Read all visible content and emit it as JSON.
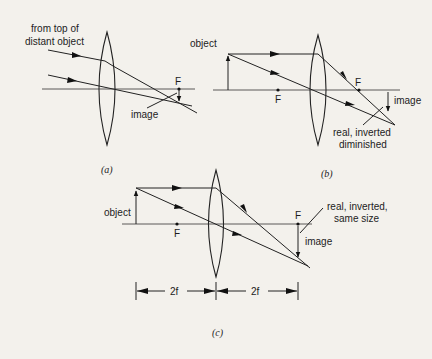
{
  "figure": {
    "panels": [
      {
        "id": "a",
        "caption": "(a)",
        "labels": {
          "source_line1": "from top of",
          "source_line2": "distant object",
          "focal_point": "F",
          "image": "image"
        }
      },
      {
        "id": "b",
        "caption": "(b)",
        "labels": {
          "object": "object",
          "focal_left": "F",
          "focal_right": "F",
          "image": "image",
          "description_line1": "real, inverted",
          "description_line2": "diminished"
        }
      },
      {
        "id": "c",
        "caption": "(c)",
        "labels": {
          "object": "object",
          "focal_left": "F",
          "focal_right": "F",
          "image": "image",
          "description_line1": "real, inverted,",
          "description_line2": "same size",
          "distance_left": "2f",
          "distance_right": "2f"
        }
      }
    ]
  },
  "colors": {
    "background": "#f3f1ec",
    "ink": "#222222"
  }
}
